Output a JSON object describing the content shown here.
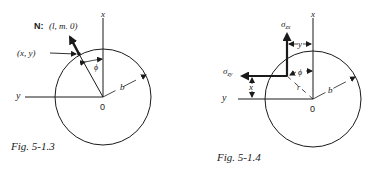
{
  "figures": [
    {
      "caption": "Fig. 5-1.3",
      "normal_label_prefix": "N:",
      "normal_label_value": "(l, m. 0)",
      "point_label": "(x, y)",
      "axis_x": "x",
      "axis_y": "y",
      "origin": "0",
      "angle": "ϕ",
      "radius": "b"
    },
    {
      "caption": "Fig. 5-1.4",
      "sigma_zx": "σ",
      "sigma_zx_sub": "zx",
      "sigma_zy": "σ",
      "sigma_zy_sub": "zy",
      "dim_y": "y",
      "dim_x": "x",
      "axis_x": "x",
      "axis_y": "y",
      "origin": "0",
      "angle": "ϕ",
      "r_label": "r",
      "radius": "b"
    }
  ],
  "colors": {
    "ink": "#1a1a1a",
    "background": "#ffffff"
  }
}
